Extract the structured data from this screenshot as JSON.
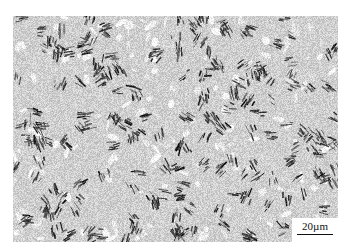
{
  "image": {
    "subject": "optical micrograph of lath/acicular steel microstructure",
    "tone": "grayscale",
    "colors": {
      "background": "#ffffff",
      "dark": "#2a2a2a",
      "light": "#f2f2f2"
    }
  },
  "scale_bar": {
    "label": "20µm"
  }
}
